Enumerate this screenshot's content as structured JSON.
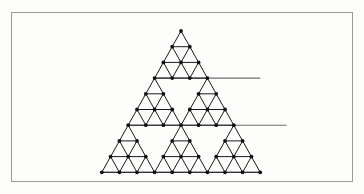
{
  "figure": {
    "kind": "geometric-diagram",
    "canvas": {
      "width": 364,
      "height": 194,
      "background": "#fdfdfc"
    },
    "frame": {
      "x": 11.5,
      "y": 12.5,
      "width": 341,
      "height": 169,
      "stroke": "#9a9a9a",
      "stroke_width": 1,
      "fill": "#fdfdfc"
    },
    "colors": {
      "edge": "#1a1a1a",
      "connector": "#6e6e6e",
      "node": "#101010",
      "frame": "#9a9a9a",
      "background": "#fdfdfc"
    },
    "geometry": {
      "apex_x": 181,
      "apex_y": 31,
      "cell_width": 17.6,
      "cell_height": 15.7,
      "block_subdivisions": 3,
      "order": 2,
      "node_radius": 1.9,
      "edge_width": 1,
      "connector_width": 1.1
    },
    "blocks": [
      {
        "name": "apex-block",
        "row": 0,
        "col": 0,
        "label": "top"
      },
      {
        "name": "upper-left-block",
        "row": 1,
        "col": 0,
        "label": "upper-left"
      },
      {
        "name": "upper-right-block",
        "row": 1,
        "col": 1,
        "label": "upper-right"
      },
      {
        "name": "bottom-left-block",
        "row": 2,
        "col": 0,
        "label": "bottom-left"
      },
      {
        "name": "bottom-middle-block",
        "row": 2,
        "col": 1,
        "label": "bottom-middle"
      },
      {
        "name": "bottom-right-block",
        "row": 2,
        "col": 2,
        "label": "bottom-right"
      }
    ],
    "connectors": [
      {
        "name": "connector-row1",
        "grid_row": 3,
        "from_col": 0,
        "to_col": 6
      },
      {
        "name": "connector-row2",
        "grid_row": 6,
        "from_col": 0,
        "to_col": 9
      },
      {
        "name": "connector-row3",
        "grid_row": 9,
        "from_col": 0,
        "to_col": 9
      }
    ],
    "counts": {
      "blocks": 6,
      "nodes_per_block": 10,
      "unit_triangles_per_block": 9,
      "total_nodes": 60
    }
  }
}
